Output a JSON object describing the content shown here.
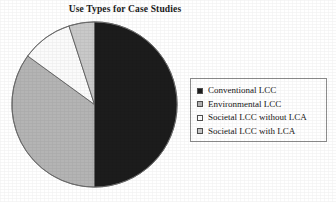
{
  "chart_data": {
    "type": "pie",
    "title": "Use Types for Case Studies",
    "subtitle": "",
    "xlabel": "",
    "ylabel": "",
    "legend_position": "right",
    "grid": false,
    "categories": [
      "Conventional LCC",
      "Environmental LCC",
      "Societal LCC without LCA",
      "Societal LCC with LCA"
    ],
    "values": [
      50,
      35,
      10,
      5
    ],
    "units": "percent",
    "start_angle_deg": 0,
    "direction": "clockwise",
    "slices": [
      {
        "label": "Conventional LCC",
        "value": 50,
        "angle_deg": 180,
        "color": "#1c1c1c",
        "swatch": "#1c1c1c"
      },
      {
        "label": "Environmental LCC",
        "value": 35,
        "angle_deg": 126,
        "color": "#b4b4b4",
        "swatch": "#b4b4b4"
      },
      {
        "label": "Societal LCC without LCA",
        "value": 10,
        "angle_deg": 36,
        "color": "#fbfbfb",
        "swatch": "#fdfdfd"
      },
      {
        "label": "Societal LCC with LCA",
        "value": 5,
        "angle_deg": 18,
        "color": "#c9c9c9",
        "swatch": "#c9c9c9"
      }
    ]
  },
  "legend": {
    "items": [
      {
        "label": "Conventional LCC",
        "color": "#1c1c1c"
      },
      {
        "label": "Environmental LCC",
        "color": "#b4b4b4"
      },
      {
        "label": "Societal LCC without LCA",
        "color": "#fdfdfd"
      },
      {
        "label": "Societal LCC with LCA",
        "color": "#c9c9c9"
      }
    ]
  },
  "colors": {
    "border": "#8d8d8d",
    "text": "#161616",
    "background": "#ffffff",
    "slice_outline": "#555555"
  }
}
